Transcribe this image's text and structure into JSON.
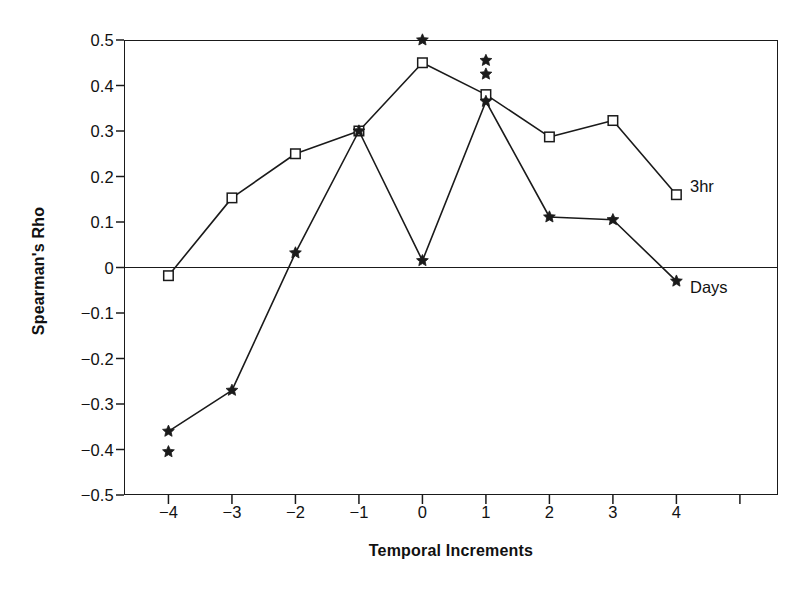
{
  "chart_data": {
    "type": "line",
    "title": "",
    "xlabel": "Temporal Increments",
    "ylabel": "Spearman's Rho",
    "x": [
      -4,
      -3,
      -2,
      -1,
      0,
      1,
      2,
      3,
      4
    ],
    "xlim": [
      -4.7,
      5.6
    ],
    "ylim": [
      -0.5,
      0.5
    ],
    "xticks": [
      "−4",
      "−3",
      "−2",
      "−1",
      "0",
      "1",
      "2",
      "3",
      "4"
    ],
    "yticks": [
      "0.5",
      "0.4",
      "0.3",
      "0.2",
      "0.1",
      "0",
      "−0.1",
      "−0.2",
      "−0.3",
      "−0.4",
      "−0.5"
    ],
    "ytick_values": [
      0.5,
      0.4,
      0.3,
      0.2,
      0.1,
      0,
      -0.1,
      -0.2,
      -0.3,
      -0.4,
      -0.5
    ],
    "grid": false,
    "legend_position": "inline-right-end-of-series",
    "zero_line": true,
    "series": [
      {
        "name": "3hr",
        "marker": "open-square",
        "color": "#1a1a1a",
        "values": [
          -0.018,
          0.153,
          0.25,
          0.3,
          0.45,
          0.38,
          0.287,
          0.323,
          0.16
        ]
      },
      {
        "name": "Days",
        "marker": "filled-star",
        "color": "#1a1a1a",
        "values": [
          -0.36,
          -0.27,
          0.032,
          0.3,
          0.015,
          0.365,
          0.111,
          0.105,
          -0.03
        ]
      }
    ],
    "significance_markers": [
      {
        "x": -4,
        "y": -0.405,
        "symbol": "star"
      },
      {
        "x": 0,
        "y": 0.5,
        "symbol": "star"
      },
      {
        "x": 1,
        "y": 0.455,
        "symbol": "star"
      },
      {
        "x": 1,
        "y": 0.425,
        "symbol": "star"
      }
    ],
    "annotations": [
      {
        "text": "3hr",
        "x": 4,
        "y": 0.16
      },
      {
        "text": "Days",
        "x": 4,
        "y": -0.03
      }
    ]
  }
}
